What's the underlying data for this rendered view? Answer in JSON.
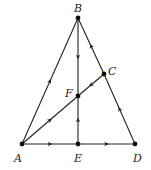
{
  "diagram": {
    "type": "directed graph",
    "nodes": [
      {
        "id": "A",
        "label": "A",
        "x": 22,
        "y": 144,
        "lx": 14,
        "ly": 162
      },
      {
        "id": "B",
        "label": "B",
        "x": 78,
        "y": 18,
        "lx": 74,
        "ly": 12
      },
      {
        "id": "C",
        "label": "C",
        "x": 104,
        "y": 74,
        "lx": 108,
        "ly": 75
      },
      {
        "id": "D",
        "label": "D",
        "x": 135,
        "y": 144,
        "lx": 133,
        "ly": 162
      },
      {
        "id": "E",
        "label": "E",
        "x": 78,
        "y": 144,
        "lx": 74,
        "ly": 162
      },
      {
        "id": "F",
        "label": "F",
        "x": 78,
        "y": 96,
        "lx": 65,
        "ly": 97
      }
    ],
    "edges": [
      {
        "from": "A",
        "to": "B"
      },
      {
        "from": "B",
        "to": "F"
      },
      {
        "from": "E",
        "to": "F"
      },
      {
        "from": "A",
        "to": "E"
      },
      {
        "from": "E",
        "to": "D"
      },
      {
        "from": "A",
        "to": "F"
      },
      {
        "from": "C",
        "to": "F"
      },
      {
        "from": "D",
        "to": "C"
      },
      {
        "from": "C",
        "to": "B"
      }
    ],
    "colors": {
      "stroke": "#222222",
      "node": "#111111"
    }
  }
}
